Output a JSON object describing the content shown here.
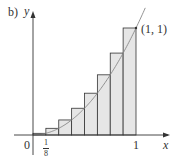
{
  "panel_label": "b)",
  "axes": {
    "x_label": "x",
    "y_label": "y",
    "origin_label": "0",
    "x_tick_one": "1",
    "x_tick_frac_num": "1",
    "x_tick_frac_den": "8"
  },
  "point_label": "(1, 1)",
  "colors": {
    "bar_fill": "#e6e6e6",
    "bar_stroke": "#333333",
    "curve": "#888888",
    "axis": "#333333"
  },
  "chart_data": {
    "type": "bar",
    "title": "b)",
    "function": "y = x^2",
    "xlabel": "x",
    "ylabel": "y",
    "xlim": [
      0,
      1
    ],
    "ylim": [
      0,
      1
    ],
    "x_ticks": [
      "0",
      "1/8",
      "1"
    ],
    "annotations": [
      {
        "text": "(1, 1)",
        "x": 1,
        "y": 1
      }
    ],
    "categories": [
      "1/8",
      "2/8",
      "3/8",
      "4/8",
      "5/8",
      "6/8",
      "7/8",
      "1"
    ],
    "bar_left_edges": [
      0,
      0.125,
      0.25,
      0.375,
      0.5,
      0.625,
      0.75,
      0.875
    ],
    "bar_width": 0.125,
    "values": [
      0.015625,
      0.0625,
      0.140625,
      0.25,
      0.390625,
      0.5625,
      0.765625,
      1.0
    ],
    "grid": false,
    "legend": null
  }
}
